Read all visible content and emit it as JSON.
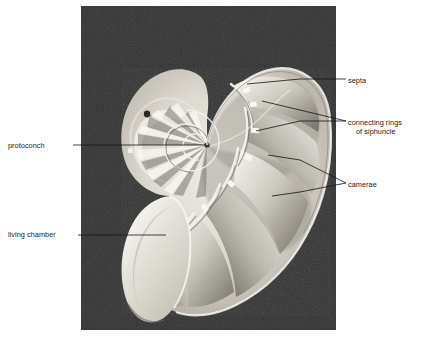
{
  "figure": {
    "kind": "anatomical-photograph-diagram",
    "photo": {
      "background_color": "#333333",
      "shell_color": "#d9d6ce",
      "left": 81,
      "top": 6,
      "width": 255,
      "height": 324
    }
  },
  "labels": {
    "septa": "septa",
    "connecting_rings_line1": "connecting rings",
    "connecting_rings_line2": "of siphuncle",
    "camerae": "camerae",
    "protoconch": "protoconch",
    "living_chamber": "living chamber"
  },
  "leader_lines": {
    "septa_color": "#111111",
    "protoconch_color": "#111111",
    "camerae_color": "#111111"
  }
}
